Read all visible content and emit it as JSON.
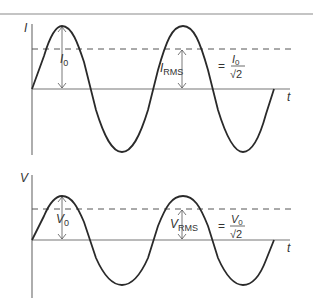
{
  "graphs": [
    {
      "id": "current",
      "y_axis_label": "I",
      "x_axis_label": "t",
      "peak_label": {
        "base": "I",
        "sub": "0"
      },
      "rms_label": {
        "base": "I",
        "sub": "RMS"
      },
      "formula": {
        "eq": "=",
        "num_base": "I",
        "num_sub": "0",
        "den": "√2"
      }
    },
    {
      "id": "voltage",
      "y_axis_label": "V",
      "x_axis_label": "t",
      "peak_label": {
        "base": "V",
        "sub": "0"
      },
      "rms_label": {
        "base": "V",
        "sub": "RMS"
      },
      "formula": {
        "eq": "=",
        "num_base": "V",
        "num_sub": "0",
        "den": "√2"
      }
    }
  ],
  "colors": {
    "curve": "#2a2a2a",
    "axis": "#777777",
    "dashed": "#555555",
    "border": "#888888"
  }
}
